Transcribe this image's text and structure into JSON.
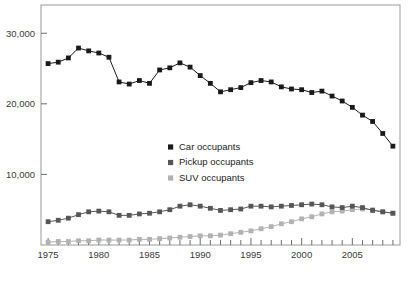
{
  "chart_data": {
    "type": "line",
    "title": "",
    "xlabel": "",
    "ylabel": "",
    "xlim": [
      1974.3,
      2009.7
    ],
    "ylim": [
      0,
      34000
    ],
    "grid": false,
    "legend_position": "center",
    "y_ticks": [
      10000,
      20000,
      30000
    ],
    "y_tick_labels": [
      "10,000",
      "20,000",
      "30,000"
    ],
    "x_ticks": [
      1975,
      1980,
      1985,
      1990,
      1995,
      2000,
      2005
    ],
    "x_tick_labels": [
      "1975",
      "1980",
      "1985",
      "1990",
      "1995",
      "2000",
      "2005"
    ],
    "x_minor_ticks_every": 1,
    "x": [
      1975,
      1976,
      1977,
      1978,
      1979,
      1980,
      1981,
      1982,
      1983,
      1984,
      1985,
      1986,
      1987,
      1988,
      1989,
      1990,
      1991,
      1992,
      1993,
      1994,
      1995,
      1996,
      1997,
      1998,
      1999,
      2000,
      2001,
      2002,
      2003,
      2004,
      2005,
      2006,
      2007,
      2008,
      2009
    ],
    "series": [
      {
        "name": "Car occupants",
        "color": "#1a1a1a",
        "marker": "square",
        "values": [
          25700,
          25900,
          26500,
          27900,
          27500,
          27200,
          26600,
          23100,
          22800,
          23300,
          22900,
          24800,
          25100,
          25800,
          25200,
          24000,
          22900,
          21700,
          22000,
          22300,
          23000,
          23300,
          23100,
          22400,
          22100,
          22000,
          21600,
          21800,
          21100,
          20400,
          19500,
          18400,
          17500,
          15800,
          14000
        ]
      },
      {
        "name": "Pickup occupants",
        "color": "#565656",
        "marker": "square",
        "values": [
          3300,
          3500,
          3800,
          4300,
          4700,
          4800,
          4700,
          4200,
          4200,
          4400,
          4500,
          4700,
          5000,
          5500,
          5700,
          5500,
          5200,
          4900,
          5000,
          5100,
          5500,
          5500,
          5400,
          5500,
          5600,
          5700,
          5800,
          5700,
          5400,
          5300,
          5500,
          5300,
          4900,
          4700,
          4500
        ]
      },
      {
        "name": "SUV occupants",
        "color": "#b2b2b2",
        "marker": "square",
        "values": [
          400,
          500,
          500,
          600,
          600,
          700,
          700,
          700,
          700,
          800,
          800,
          900,
          1000,
          1100,
          1200,
          1300,
          1300,
          1400,
          1600,
          1800,
          2000,
          2300,
          2600,
          3000,
          3300,
          3700,
          4000,
          4400,
          4700,
          4800,
          5000,
          5100,
          5000,
          4700,
          4500
        ]
      }
    ]
  },
  "legend": {
    "items": [
      {
        "label": "Car occupants",
        "color": "#1a1a1a"
      },
      {
        "label": "Pickup occupants",
        "color": "#565656"
      },
      {
        "label": "SUV occupants",
        "color": "#b2b2b2"
      }
    ]
  },
  "axes": {
    "frame_color": "#9a9a9a",
    "tick_color": "#6e6e6e",
    "label_color": "#3a3a3a"
  },
  "caption": {
    "text": ""
  }
}
